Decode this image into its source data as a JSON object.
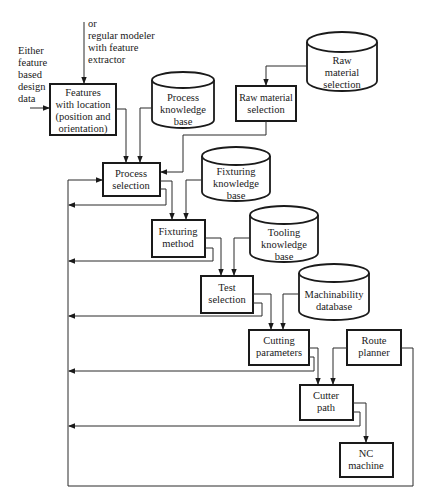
{
  "inputs": {
    "top": [
      "or",
      "regular modeler",
      "with feature",
      "extractor"
    ],
    "left": [
      "Either",
      "feature",
      "based",
      "design",
      "data"
    ]
  },
  "nodes": {
    "features": {
      "type": "process",
      "lines": [
        "Features",
        "with location",
        "(position and",
        "orientation)"
      ]
    },
    "process_kb": {
      "type": "database",
      "lines": [
        "Process",
        "knowledge",
        "base"
      ]
    },
    "raw_material_db": {
      "type": "database",
      "lines": [
        "Raw",
        "material",
        "selection"
      ]
    },
    "raw_material_selection": {
      "type": "process",
      "lines": [
        "Raw material",
        "selection"
      ]
    },
    "process_selection": {
      "type": "process",
      "lines": [
        "Process",
        "selection"
      ]
    },
    "fixturing_kb": {
      "type": "database",
      "lines": [
        "Fixturing",
        "knowledge",
        "base"
      ]
    },
    "fixturing_method": {
      "type": "process",
      "lines": [
        "Fixturing",
        "method"
      ]
    },
    "tooling_kb": {
      "type": "database",
      "lines": [
        "Tooling",
        "knowledge",
        "base"
      ]
    },
    "test_selection": {
      "type": "process",
      "lines": [
        "Test",
        "selection"
      ]
    },
    "machinability_db": {
      "type": "database",
      "lines": [
        "Machinability",
        "database"
      ]
    },
    "cutting_parameters": {
      "type": "process",
      "lines": [
        "Cutting",
        "parameters"
      ]
    },
    "route_planner": {
      "type": "process",
      "lines": [
        "Route",
        "planner"
      ]
    },
    "cutter_path": {
      "type": "process",
      "lines": [
        "Cutter",
        "path"
      ]
    },
    "nc_machine": {
      "type": "process",
      "lines": [
        "NC",
        "machine"
      ]
    }
  },
  "edges": [
    {
      "from": "top_input",
      "to": "features"
    },
    {
      "from": "left_input",
      "to": "features"
    },
    {
      "from": "features",
      "to": "process_selection"
    },
    {
      "from": "process_kb",
      "to": "process_selection"
    },
    {
      "from": "raw_material_db",
      "to": "raw_material_selection"
    },
    {
      "from": "raw_material_selection",
      "to": "process_selection"
    },
    {
      "from": "process_selection",
      "to": "fixturing_method"
    },
    {
      "from": "fixturing_kb",
      "to": "fixturing_method"
    },
    {
      "from": "fixturing_method",
      "to": "test_selection"
    },
    {
      "from": "tooling_kb",
      "to": "test_selection"
    },
    {
      "from": "test_selection",
      "to": "cutting_parameters"
    },
    {
      "from": "machinability_db",
      "to": "cutting_parameters"
    },
    {
      "from": "cutting_parameters",
      "to": "cutter_path"
    },
    {
      "from": "route_planner",
      "to": "cutter_path"
    },
    {
      "from": "cutter_path",
      "to": "nc_machine"
    },
    {
      "from": "process_selection",
      "to": "feedback_loop"
    },
    {
      "from": "fixturing_method",
      "to": "feedback_loop"
    },
    {
      "from": "test_selection",
      "to": "feedback_loop"
    },
    {
      "from": "cutting_parameters",
      "to": "feedback_loop"
    },
    {
      "from": "cutter_path",
      "to": "feedback_loop"
    },
    {
      "from": "route_planner",
      "to": "feedback_loop"
    },
    {
      "from": "feedback_loop",
      "to": "process_selection"
    }
  ]
}
